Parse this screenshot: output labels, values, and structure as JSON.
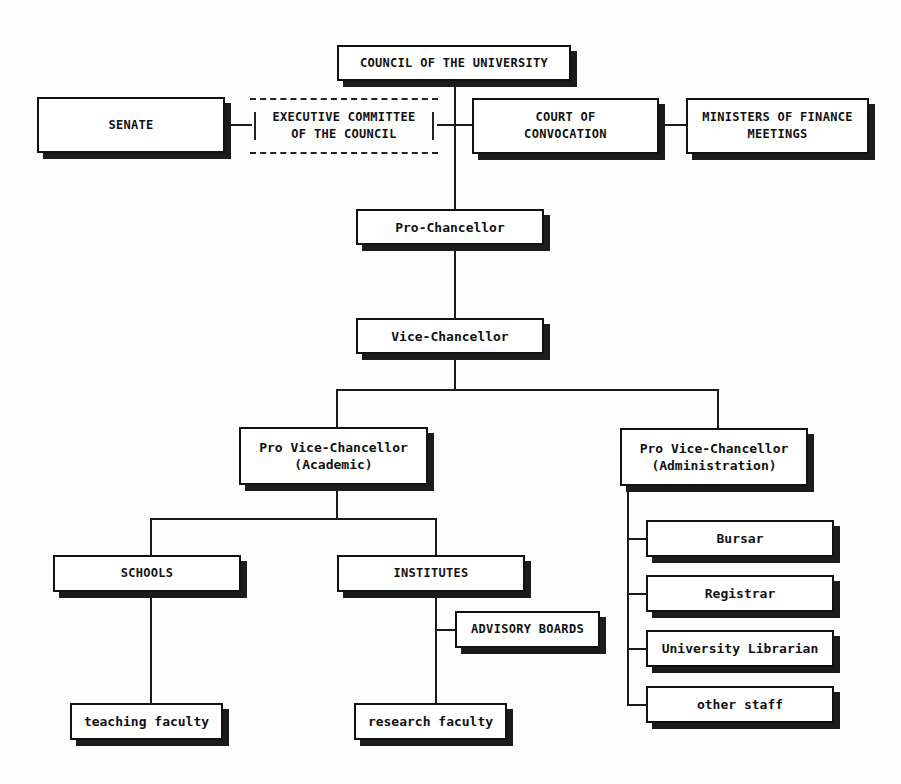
{
  "chart": {
    "type": "org-chart",
    "nodes": {
      "council": "COUNCIL OF THE UNIVERSITY",
      "senate": "SENATE",
      "executive_committee": "EXECUTIVE COMMITTEE\nOF THE COUNCIL",
      "court": "COURT OF\nCONVOCATION",
      "ministers": "MINISTERS OF FINANCE\nMEETINGS",
      "pro_chancellor": "Pro-Chancellor",
      "vice_chancellor": "Vice-Chancellor",
      "pvc_academic": "Pro Vice-Chancellor\n(Academic)",
      "pvc_admin": "Pro Vice-Chancellor\n(Administration)",
      "schools": "SCHOOLS",
      "institutes": "INSTITUTES",
      "advisory_boards": "ADVISORY BOARDS",
      "teaching_faculty": "teaching faculty",
      "research_faculty": "research faculty",
      "bursar": "Bursar",
      "registrar": "Registrar",
      "librarian": "University Librarian",
      "other_staff": "other staff"
    },
    "edges": [
      [
        "council",
        "pro_chancellor"
      ],
      [
        "senate",
        "executive_committee"
      ],
      [
        "executive_committee",
        "council"
      ],
      [
        "council",
        "court"
      ],
      [
        "court",
        "ministers"
      ],
      [
        "pro_chancellor",
        "vice_chancellor"
      ],
      [
        "vice_chancellor",
        "pvc_academic"
      ],
      [
        "vice_chancellor",
        "pvc_admin"
      ],
      [
        "pvc_academic",
        "schools"
      ],
      [
        "pvc_academic",
        "institutes"
      ],
      [
        "institutes",
        "advisory_boards"
      ],
      [
        "schools",
        "teaching_faculty"
      ],
      [
        "institutes",
        "research_faculty"
      ],
      [
        "pvc_admin",
        "bursar"
      ],
      [
        "pvc_admin",
        "registrar"
      ],
      [
        "pvc_admin",
        "librarian"
      ],
      [
        "pvc_admin",
        "other_staff"
      ]
    ]
  }
}
